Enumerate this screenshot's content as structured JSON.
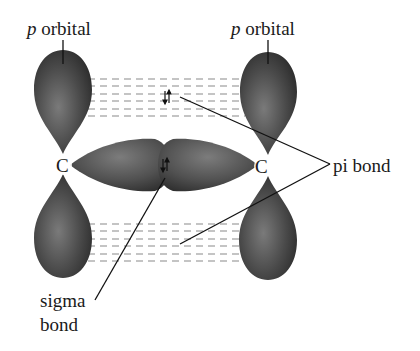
{
  "diagram": {
    "labels": {
      "p_orbital_left": {
        "italic": "p",
        "text": " orbital"
      },
      "p_orbital_right": {
        "italic": "p",
        "text": " orbital"
      },
      "pi_bond": "pi bond",
      "sigma_bond_line1": "sigma",
      "sigma_bond_line2": "bond",
      "carbon_left": "C",
      "carbon_right": "C"
    },
    "electron_pair_symbol": "⇅",
    "colors": {
      "lobe_dark": "#2e2e2e",
      "lobe_mid": "#6a6a6a",
      "lobe_light": "#9a9a9a",
      "dash": "#8a8a8a",
      "line": "#111111",
      "text": "#1a1a1a",
      "background": "#ffffff"
    }
  }
}
